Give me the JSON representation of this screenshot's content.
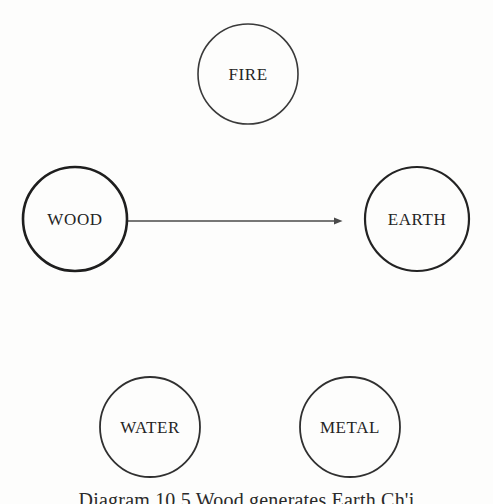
{
  "figure": {
    "kind": "five-elements-cycle-diagram",
    "background_color": "#fdfdfc",
    "ink_color": "#242424",
    "caption": "Diagram 10.5 Wood generates Earth Ch'i",
    "caption_number": "10.5"
  },
  "chart_data": {
    "type": "diagram",
    "title": "Diagram 10.5 Wood generates Earth Ch'i",
    "nodes": [
      {
        "id": "fire",
        "label": "FIRE",
        "cx": 248,
        "cy": 74,
        "r": 50,
        "stroke_width": 1.6,
        "stroke_color": "#3a3a3a"
      },
      {
        "id": "wood",
        "label": "WOOD",
        "cx": 75,
        "cy": 219,
        "r": 52,
        "stroke_width": 2.6,
        "stroke_color": "#1e1e1e"
      },
      {
        "id": "earth",
        "label": "EARTH",
        "cx": 417,
        "cy": 219,
        "r": 52,
        "stroke_width": 2.2,
        "stroke_color": "#232323"
      },
      {
        "id": "water",
        "label": "WATER",
        "cx": 150,
        "cy": 427,
        "r": 50,
        "stroke_width": 1.8,
        "stroke_color": "#303030"
      },
      {
        "id": "metal",
        "label": "METAL",
        "cx": 350,
        "cy": 427,
        "r": 50,
        "stroke_width": 1.8,
        "stroke_color": "#303030"
      }
    ],
    "edges": [
      {
        "id": "wood-to-earth",
        "from": "wood",
        "to": "earth",
        "label": "",
        "style": "solid-arrow",
        "x1": 128,
        "y1": 221,
        "x2": 362,
        "y2": 221,
        "line_width": 1.4,
        "color": "#4a4a4a",
        "arrowhead": "filled-triangle"
      }
    ],
    "legend": [],
    "grid": false
  }
}
